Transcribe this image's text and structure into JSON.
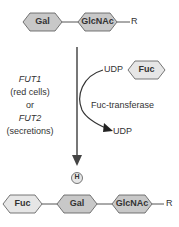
{
  "substrate": {
    "sugars": [
      "Gal",
      "GlcNAc"
    ],
    "tail": "R"
  },
  "enzymes": {
    "gene1": "FUT1",
    "gene1_note": "(red cells)",
    "or": "or",
    "gene2": "FUT2",
    "gene2_note": "(secretions)"
  },
  "donor": {
    "udp_in": "UDP",
    "sugar": "Fuc",
    "enzyme": "Fuc-transferase",
    "udp_out": "UDP"
  },
  "product": {
    "antigen": "H",
    "sugars": [
      "Fuc",
      "Gal",
      "GlcNAc"
    ],
    "tail": "R"
  },
  "colors": {
    "dark_hex": "#c8c8c8",
    "light_hex": "#e6e6e6",
    "stroke": "#555555"
  }
}
